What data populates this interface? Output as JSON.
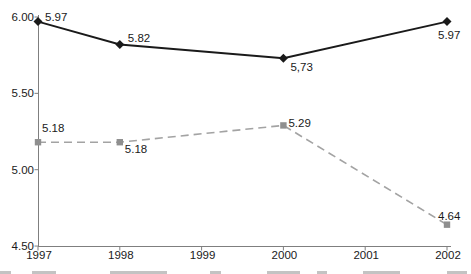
{
  "chart_data": {
    "type": "line",
    "title": "",
    "xlabel": "",
    "ylabel": "",
    "x": [
      1997,
      1998,
      1999,
      2000,
      2001,
      2002
    ],
    "xtick_labels": [
      "1997",
      "1998",
      "1999",
      "2000",
      "2001",
      "2002"
    ],
    "ytick_labels": [
      "6.00",
      "5.50",
      "5.00",
      "4.50"
    ],
    "ytick_values": [
      6.0,
      5.5,
      5.0,
      4.5
    ],
    "ylim": [
      4.5,
      6.0
    ],
    "grid": false,
    "legend": "none",
    "colors": {
      "series1": "#1a1a1a",
      "series2": "#a3a3a3",
      "series2_marker": "#8f8f8f",
      "axis": "#7f7f7f",
      "label_text": "#1a1a1a"
    },
    "series": [
      {
        "name": "upper-solid-line",
        "marker": "diamond",
        "line_style": "solid",
        "points": [
          {
            "x": 1997,
            "y": 5.97,
            "label": "5.97",
            "dx": 7,
            "dy": -1
          },
          {
            "x": 1998,
            "y": 5.82,
            "label": "5.82",
            "dx": 8,
            "dy": -2
          },
          {
            "x": 2000,
            "y": 5.73,
            "label": "5,73",
            "dx": 7,
            "dy": 13
          },
          {
            "x": 2002,
            "y": 5.97,
            "label": "5.97",
            "dx": -9,
            "dy": 17
          }
        ]
      },
      {
        "name": "lower-dashed-line",
        "marker": "square",
        "line_style": "dashed",
        "points": [
          {
            "x": 1997,
            "y": 5.18,
            "label": "5.18",
            "dx": 4,
            "dy": -10
          },
          {
            "x": 1998,
            "y": 5.18,
            "label": "5.18",
            "dx": 5,
            "dy": 11
          },
          {
            "x": 2000,
            "y": 5.29,
            "label": "5.29",
            "dx": 5,
            "dy": 2
          },
          {
            "x": 2002,
            "y": 4.64,
            "label": "4.64",
            "dx": -9,
            "dy": -5
          }
        ]
      }
    ]
  }
}
